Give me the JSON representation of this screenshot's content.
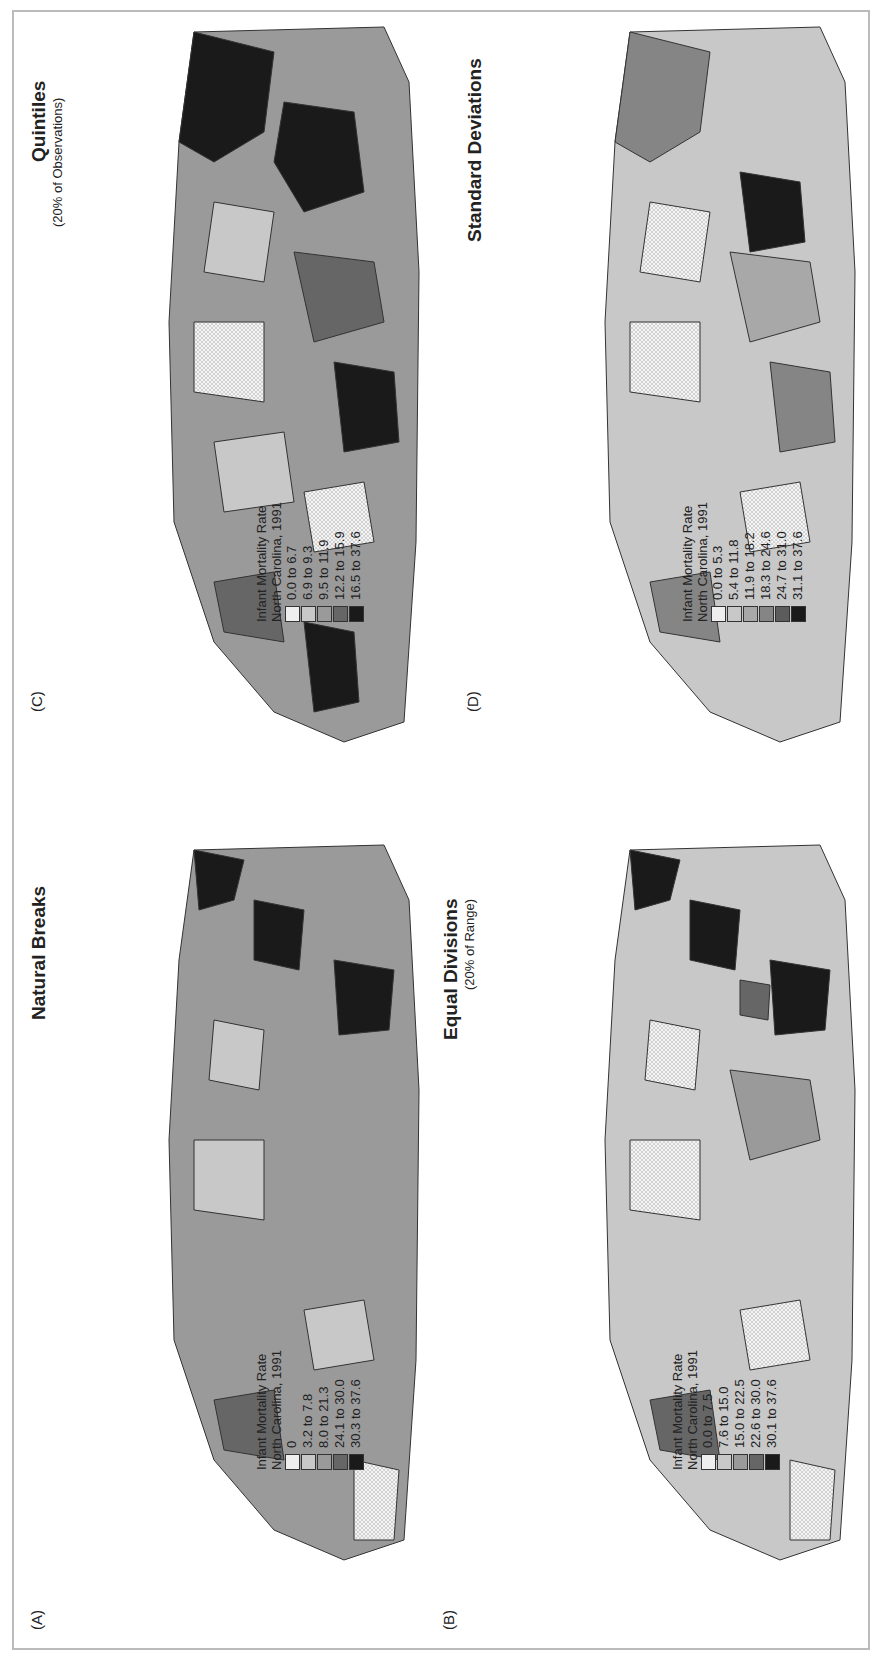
{
  "figure": {
    "legend_title_line1": "Infant Mortality Rate",
    "legend_title_line2": "North Carolina, 1991",
    "panels": [
      {
        "id": "A",
        "label": "(A)",
        "title": "Natural Breaks",
        "subtitle": "",
        "classes": [
          {
            "label": "0",
            "color": "#eeeeee",
            "pattern": "crosshatch"
          },
          {
            "label": "3.2 to 7.8",
            "color": "#c8c8c8"
          },
          {
            "label": "8.0 to 21.3",
            "color": "#9a9a9a"
          },
          {
            "label": "24.1 to 30.0",
            "color": "#666666"
          },
          {
            "label": "30.3 to 37.6",
            "color": "#1a1a1a"
          }
        ]
      },
      {
        "id": "B",
        "label": "(B)",
        "title": "Equal Divisions",
        "subtitle": "(20% of Range)",
        "classes": [
          {
            "label": "0.0 to 7.5",
            "color": "#eeeeee",
            "pattern": "crosshatch"
          },
          {
            "label": "7.6 to 15.0",
            "color": "#c8c8c8"
          },
          {
            "label": "15.0 to 22.5",
            "color": "#9a9a9a"
          },
          {
            "label": "22.6 to 30.0",
            "color": "#666666"
          },
          {
            "label": "30.1 to 37.6",
            "color": "#1a1a1a"
          }
        ]
      },
      {
        "id": "C",
        "label": "(C)",
        "title": "Quintiles",
        "subtitle": "(20% of Observations)",
        "classes": [
          {
            "label": "0.0 to 6.7",
            "color": "#eeeeee",
            "pattern": "crosshatch"
          },
          {
            "label": "6.9 to 9.3",
            "color": "#c8c8c8"
          },
          {
            "label": "9.5 to 11.9",
            "color": "#9a9a9a"
          },
          {
            "label": "12.2 to 15.9",
            "color": "#666666"
          },
          {
            "label": "16.5 to 37.6",
            "color": "#1a1a1a"
          }
        ]
      },
      {
        "id": "D",
        "label": "(D)",
        "title": "Standard Deviations",
        "subtitle": "",
        "classes": [
          {
            "label": "0.0 to 5.3",
            "color": "#eeeeee",
            "pattern": "crosshatch"
          },
          {
            "label": "5.4 to 11.8",
            "color": "#c8c8c8"
          },
          {
            "label": "11.9 to 18.2",
            "color": "#a8a8a8"
          },
          {
            "label": "18.3 to 24.6",
            "color": "#858585"
          },
          {
            "label": "24.7 to 31.0",
            "color": "#5c5c5c"
          },
          {
            "label": "31.1 to 37.6",
            "color": "#1a1a1a"
          }
        ]
      }
    ]
  }
}
